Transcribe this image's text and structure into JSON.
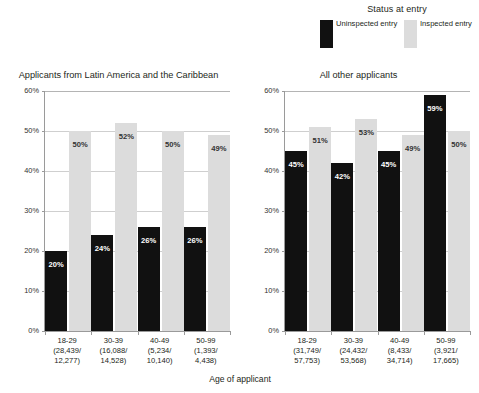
{
  "legend": {
    "title": "Status at entry",
    "entries": [
      {
        "label": "Uninspected entry",
        "color": "#111111",
        "key": "uninspected"
      },
      {
        "label": "Inspected entry",
        "color": "#dcdcdc",
        "key": "inspected"
      }
    ]
  },
  "axis": {
    "x_label": "Age of applicant",
    "y_ticks": [
      "60%",
      "50%",
      "40%",
      "30%",
      "20%",
      "10%",
      "0%"
    ]
  },
  "panels": [
    {
      "title": "Applicants from Latin America and the Caribbean",
      "groups": [
        {
          "age": "18-29",
          "counts": "(28,439/\n12,277)",
          "uninspected": 20,
          "inspected": 50,
          "uninspected_label": "20%",
          "inspected_label": "50%"
        },
        {
          "age": "30-39",
          "counts": "(16,088/\n14,528)",
          "uninspected": 24,
          "inspected": 52,
          "uninspected_label": "24%",
          "inspected_label": "52%"
        },
        {
          "age": "40-49",
          "counts": "(5,234/\n10,140)",
          "uninspected": 26,
          "inspected": 50,
          "uninspected_label": "26%",
          "inspected_label": "50%"
        },
        {
          "age": "50-99",
          "counts": "(1,393/\n4,438)",
          "uninspected": 26,
          "inspected": 49,
          "uninspected_label": "26%",
          "inspected_label": "49%"
        }
      ]
    },
    {
      "title": "All other applicants",
      "groups": [
        {
          "age": "18-29",
          "counts": "(31,749/\n57,753)",
          "uninspected": 45,
          "inspected": 51,
          "uninspected_label": "45%",
          "inspected_label": "51%"
        },
        {
          "age": "30-39",
          "counts": "(24,432/\n53,568)",
          "uninspected": 42,
          "inspected": 53,
          "uninspected_label": "42%",
          "inspected_label": "53%"
        },
        {
          "age": "40-49",
          "counts": "(8,433/\n34,714)",
          "uninspected": 45,
          "inspected": 49,
          "uninspected_label": "45%",
          "inspected_label": "49%"
        },
        {
          "age": "50-99",
          "counts": "(3,921/\n17,665)",
          "uninspected": 59,
          "inspected": 50,
          "uninspected_label": "59%",
          "inspected_label": "50%"
        }
      ]
    }
  ],
  "chart_data": {
    "type": "bar",
    "title": "",
    "xlabel": "Age of applicant",
    "ylabel": "",
    "ylim": [
      0,
      60
    ],
    "ytick_values": [
      0,
      10,
      20,
      30,
      40,
      50,
      60
    ],
    "ytick_labels": [
      "0%",
      "10%",
      "20%",
      "30%",
      "40%",
      "50%",
      "60%"
    ],
    "grid": true,
    "legend_title": "Status at entry",
    "legend_position": "top-right",
    "panels": [
      {
        "title": "Applicants from Latin America and the Caribbean",
        "categories": [
          "18-29",
          "30-39",
          "40-49",
          "50-99"
        ],
        "category_counts": [
          "(28,439/12,277)",
          "(16,088/14,528)",
          "(5,234/10,140)",
          "(1,393/4,438)"
        ],
        "series": [
          {
            "name": "Uninspected entry",
            "color": "#111111",
            "values": [
              20,
              24,
              26,
              26
            ]
          },
          {
            "name": "Inspected entry",
            "color": "#dcdcdc",
            "values": [
              50,
              52,
              50,
              49
            ]
          }
        ]
      },
      {
        "title": "All other applicants",
        "categories": [
          "18-29",
          "30-39",
          "40-49",
          "50-99"
        ],
        "category_counts": [
          "(31,749/57,753)",
          "(24,432/53,568)",
          "(8,433/34,714)",
          "(3,921/17,665)"
        ],
        "series": [
          {
            "name": "Uninspected entry",
            "color": "#111111",
            "values": [
              45,
              42,
              45,
              59
            ]
          },
          {
            "name": "Inspected entry",
            "color": "#dcdcdc",
            "values": [
              51,
              53,
              49,
              50
            ]
          }
        ]
      }
    ]
  }
}
